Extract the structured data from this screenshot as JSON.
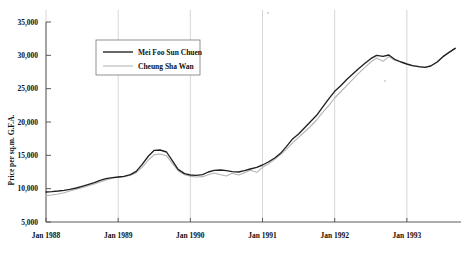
{
  "chart_data": {
    "type": "line",
    "title": "",
    "subtitle": "",
    "xlabel": "",
    "ylabel": "Price per sq.m. G.F.A.",
    "ylim": [
      5000,
      35000
    ],
    "ytick_labels": [
      "5,000",
      "10,000",
      "15,000",
      "20,000",
      "25,000",
      "30,000",
      "35,000"
    ],
    "ytick_values": [
      5000,
      10000,
      15000,
      20000,
      25000,
      30000,
      35000
    ],
    "xtick_labels": [
      "Jan 1988",
      "Jan 1989",
      "Jan 1990",
      "Jan 1991",
      "Jan 1992",
      "Jan 1993"
    ],
    "xtick_values": [
      1988.0,
      1989.0,
      1990.0,
      1991.0,
      1992.0,
      1993.0
    ],
    "xlim": [
      1988.0,
      1993.75
    ],
    "grid": "vertical-only",
    "legend_position": "upper-left-inside",
    "legend_entries": [
      "Mei Foo Sun Chuen",
      "Cheung Sha Wan"
    ],
    "series": [
      {
        "name": "Mei Foo Sun Chuen",
        "color": "#202020",
        "x": [
          1988.0,
          1988.08,
          1988.17,
          1988.25,
          1988.33,
          1988.42,
          1988.5,
          1988.58,
          1988.67,
          1988.75,
          1988.83,
          1988.92,
          1989.0,
          1989.08,
          1989.17,
          1989.25,
          1989.33,
          1989.42,
          1989.5,
          1989.58,
          1989.67,
          1989.75,
          1989.83,
          1989.92,
          1990.0,
          1990.08,
          1990.17,
          1990.25,
          1990.33,
          1990.42,
          1990.5,
          1990.58,
          1990.67,
          1990.75,
          1990.83,
          1990.92,
          1991.0,
          1991.08,
          1991.17,
          1991.25,
          1991.33,
          1991.42,
          1991.5,
          1991.58,
          1991.67,
          1991.75,
          1991.83,
          1991.92,
          1992.0,
          1992.08,
          1992.17,
          1992.25,
          1992.33,
          1992.42,
          1992.5,
          1992.58,
          1992.67,
          1992.75,
          1992.83,
          1992.92,
          1993.0,
          1993.08,
          1993.17,
          1993.25,
          1993.33,
          1993.42,
          1993.5,
          1993.58,
          1993.67
        ],
        "y": [
          9500,
          9560,
          9650,
          9750,
          9900,
          10100,
          10350,
          10600,
          10900,
          11250,
          11500,
          11650,
          11750,
          11850,
          12100,
          12600,
          13600,
          14900,
          15750,
          15800,
          15500,
          14200,
          12900,
          12250,
          12050,
          12000,
          12100,
          12500,
          12750,
          12800,
          12700,
          12550,
          12500,
          12700,
          12950,
          13200,
          13550,
          14000,
          14600,
          15300,
          16300,
          17500,
          18200,
          19100,
          20100,
          21000,
          22200,
          23500,
          24600,
          25400,
          26400,
          27200,
          28000,
          28800,
          29500,
          30000,
          29850,
          30050,
          29400,
          29000,
          28700,
          28450,
          28300,
          28200,
          28400,
          29000,
          29800,
          30400,
          31050
        ]
      },
      {
        "name": "Cheung Sha Wan",
        "color": "#b4b4b4",
        "x": [
          1988.0,
          1988.08,
          1988.17,
          1988.25,
          1988.33,
          1988.42,
          1988.5,
          1988.58,
          1988.67,
          1988.75,
          1988.83,
          1988.92,
          1989.0,
          1989.08,
          1989.17,
          1989.25,
          1989.33,
          1989.42,
          1989.5,
          1989.58,
          1989.67,
          1989.75,
          1989.83,
          1989.92,
          1990.0,
          1990.08,
          1990.17,
          1990.25,
          1990.33,
          1990.42,
          1990.5,
          1990.58,
          1990.67,
          1990.75,
          1990.83,
          1990.92,
          1991.0,
          1991.08,
          1991.17,
          1991.25,
          1991.33,
          1991.42,
          1991.5,
          1991.58,
          1991.67,
          1991.75,
          1991.83,
          1991.92,
          1992.0,
          1992.08,
          1992.17,
          1992.25,
          1992.33,
          1992.42,
          1992.5,
          1992.58,
          1992.67,
          1992.75,
          1992.83,
          1992.92,
          1993.0,
          1993.08,
          1993.17,
          1993.25,
          1993.33,
          1993.42,
          1993.5,
          1993.58,
          1993.67
        ],
        "y": [
          8950,
          9050,
          9200,
          9400,
          9650,
          9900,
          10150,
          10400,
          10700,
          11000,
          11300,
          11550,
          11700,
          11800,
          12000,
          12400,
          13200,
          14300,
          15100,
          15200,
          14950,
          13800,
          12700,
          12100,
          11850,
          11750,
          11800,
          12100,
          12350,
          12100,
          11900,
          12300,
          12050,
          12400,
          12750,
          12450,
          13200,
          13700,
          14400,
          15100,
          15900,
          16900,
          17700,
          18500,
          19400,
          20300,
          21400,
          22500,
          23600,
          24500,
          25500,
          26400,
          27300,
          28200,
          29000,
          29600,
          29100,
          29800,
          29300,
          28950,
          28650,
          28400,
          28250,
          28200,
          28400,
          29000,
          29800,
          30400,
          31050
        ]
      }
    ]
  }
}
